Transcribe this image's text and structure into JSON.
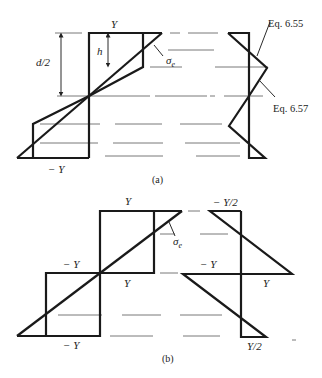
{
  "figure_a": {
    "caption": "(a)",
    "labels": {
      "top_stress": "Y",
      "bottom_stress": "− Y",
      "half_depth": "d/2",
      "elastic_core": "h",
      "elastic_stress": "σ",
      "elastic_stress_sub": "e",
      "eq_upper": "Eq. 6.55",
      "eq_lower": "Eq. 6.57"
    }
  },
  "figure_b": {
    "caption": "(b)",
    "labels": {
      "top_stress": "Y",
      "mid_left_stress": "− Y",
      "mid_right_stress": "Y",
      "bottom_stress": "− Y",
      "elastic_stress": "σ",
      "elastic_stress_sub": "e",
      "residual_top": "− Y/2",
      "residual_mid_left": "− Y",
      "residual_mid_right": "Y",
      "residual_bottom": "Y/2"
    }
  }
}
